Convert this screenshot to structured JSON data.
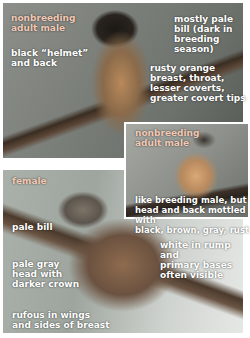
{
  "colors": {
    "section_label": "#f2c9b5",
    "annotation": "#ffffff",
    "background": "#ffffff"
  },
  "panels": {
    "top": {
      "section_label": "nonbreeding\nadult male",
      "annotations": [
        "black “helmet”\nand back",
        "mostly pale\nbill (dark in\nbreeding\nseason)",
        "rusty orange\nbreast, throat,\nlesser coverts,\ngreater covert tips"
      ]
    },
    "inset": {
      "section_label": "nonbreeding\nadult male",
      "annotations": [
        "like breeding male, but\nhead and back mottled with\nblack, brown, gray, rust"
      ]
    },
    "female": {
      "section_label": "female",
      "annotations": [
        "pale bill",
        "white in rump and\nprimary bases\noften visible",
        "pale gray\nhead with\ndarker crown",
        "rufous in wings\nand sides of breast"
      ]
    }
  }
}
